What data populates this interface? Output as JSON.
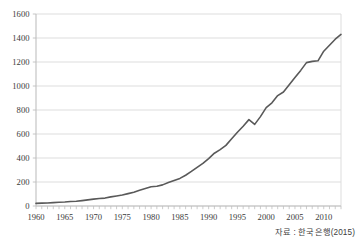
{
  "source_note": "자료 : 한국은행(2015)",
  "colors": {
    "line": "#595959",
    "grid": "#d9d9d9",
    "axis": "#bfbfbf",
    "tick_text": "#3a3a3a",
    "background": "#ffffff"
  },
  "chart_data": {
    "type": "line",
    "title": "",
    "subtitle": "",
    "xlabel": "",
    "ylabel": "",
    "xlim": [
      1960,
      2013
    ],
    "ylim": [
      0,
      1600
    ],
    "grid": "horizontal",
    "legend": "none",
    "y_ticks": [
      0,
      200,
      400,
      600,
      800,
      1000,
      1200,
      1400,
      1600
    ],
    "y_tick_labels": [
      "0",
      "200",
      "400",
      "600",
      "800",
      "1000",
      "1200",
      "1400",
      "1600"
    ],
    "x_ticks": [
      1960,
      1965,
      1970,
      1975,
      1980,
      1985,
      1990,
      1995,
      2000,
      2005,
      2010
    ],
    "x_tick_labels": [
      "1960",
      "1965",
      "1970",
      "1975",
      "1980",
      "1985",
      "1990",
      "1995",
      "2000",
      "2005",
      "2010"
    ],
    "x_minor_tick_step": 1,
    "annotations": [
      "자료 : 한국은행(2015)"
    ],
    "series": [
      {
        "name": "GDP",
        "x": [
          1960,
          1961,
          1962,
          1963,
          1964,
          1965,
          1966,
          1967,
          1968,
          1969,
          1970,
          1971,
          1972,
          1973,
          1974,
          1975,
          1976,
          1977,
          1978,
          1979,
          1980,
          1981,
          1982,
          1983,
          1984,
          1985,
          1986,
          1987,
          1988,
          1989,
          1990,
          1991,
          1992,
          1993,
          1994,
          1995,
          1996,
          1997,
          1998,
          1999,
          2000,
          2001,
          2002,
          2003,
          2004,
          2005,
          2006,
          2007,
          2008,
          2009,
          2010,
          2011,
          2012,
          2013
        ],
        "values": [
          22,
          24,
          25,
          28,
          31,
          33,
          37,
          40,
          45,
          51,
          57,
          62,
          66,
          76,
          84,
          91,
          103,
          115,
          131,
          145,
          160,
          165,
          176,
          195,
          213,
          230,
          256,
          288,
          322,
          355,
          395,
          440,
          470,
          505,
          560,
          615,
          665,
          720,
          680,
          745,
          820,
          860,
          920,
          950,
          1010,
          1070,
          1130,
          1195,
          1205,
          1210,
          1290,
          1340,
          1390,
          1430
        ],
        "color": "#595959",
        "line_width": 1.6,
        "marker": "none"
      }
    ]
  }
}
